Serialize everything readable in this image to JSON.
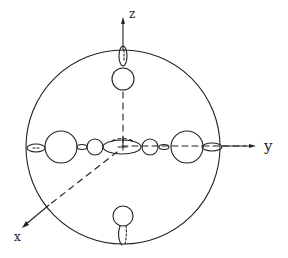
{
  "diagram": {
    "stroke_color": "#222222",
    "background": "#ffffff",
    "axes": {
      "x_label": "x",
      "y_label": "y",
      "z_label": "z"
    },
    "big_sphere": {
      "cx": 123,
      "cy": 147,
      "r": 97
    },
    "y_axis_spheres": [
      {
        "name": "left-large",
        "cx": 61,
        "cy": 147,
        "r": 16
      },
      {
        "name": "left-small",
        "cx": 95,
        "cy": 147,
        "r": 8
      },
      {
        "name": "center-disk",
        "cx": 122,
        "cy": 147,
        "rx": 18,
        "ry": 7
      },
      {
        "name": "right-small",
        "cx": 150,
        "cy": 147,
        "r": 8
      },
      {
        "name": "right-large",
        "cx": 187,
        "cy": 147,
        "r": 16
      }
    ],
    "z_axis_spheres": [
      {
        "name": "top",
        "cx": 123,
        "cy": 79,
        "r": 11
      },
      {
        "name": "bottom",
        "cx": 123,
        "cy": 216,
        "r": 10
      }
    ]
  }
}
